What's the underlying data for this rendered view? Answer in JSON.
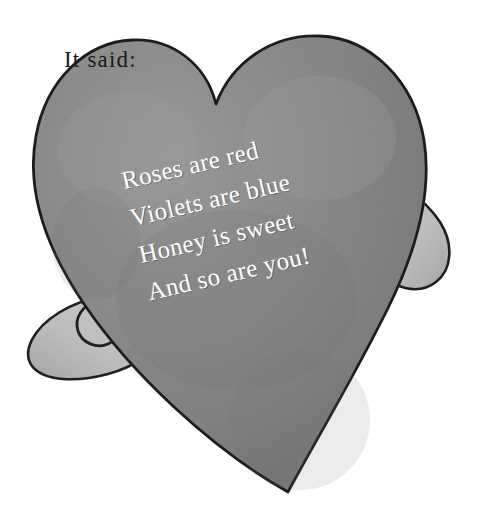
{
  "page": {
    "width": 477,
    "height": 526,
    "background_color": "#ffffff"
  },
  "caption": {
    "text": "It said:",
    "color": "#1a1a1a"
  },
  "illustration": {
    "name": "heart-with-arms",
    "description": "Grayscale storybook illustration of a large tilted heart holding itself with two mitten-shaped hands",
    "heart_color": "#878787",
    "heart_shadow_color": "#6f6f6f",
    "heart_highlight_color": "#9b9b9b",
    "hand_color": "#c3c3c3",
    "hand_shadow_color": "#a9a9a9",
    "outline_color": "#1f1f1f"
  },
  "poem": {
    "rotation_degrees": -13,
    "text_color": "#fdfdfd",
    "lines": [
      "Roses are red",
      "Violets are blue",
      "Honey is sweet",
      "And so are you!"
    ]
  }
}
